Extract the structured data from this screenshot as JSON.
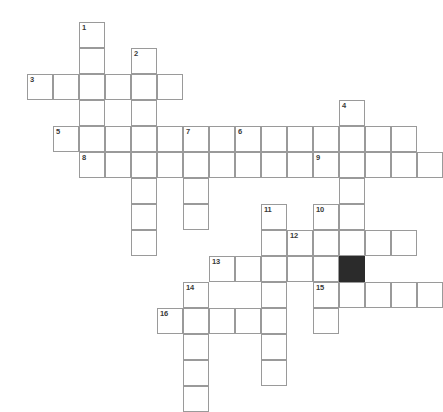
{
  "puzzle": {
    "title": "Crossword Grid",
    "grid": {
      "cell_size": 26,
      "origin_x": 1,
      "origin_y": 22,
      "columns": 17,
      "rows": 15,
      "line_color": "#9a9a9a",
      "cell_color": "#ffffff",
      "block_color": "#2b2b2b",
      "number_color": "#3a3a3a",
      "background": "#ffffff"
    },
    "blocks": [
      {
        "name": "block-cell",
        "col": 13,
        "row": 9
      }
    ],
    "entries": [
      {
        "number": "1",
        "direction": "down",
        "col": 3,
        "row": 0,
        "length": 6
      },
      {
        "number": "2",
        "direction": "down",
        "col": 5,
        "row": 1,
        "length": 7
      },
      {
        "number": "3",
        "direction": "across",
        "col": 1,
        "row": 2,
        "length": 6
      },
      {
        "number": "4",
        "direction": "down",
        "col": 13,
        "row": 3,
        "length": 4
      },
      {
        "number": "5",
        "direction": "across",
        "col": 2,
        "row": 4,
        "length": 7
      },
      {
        "number": "6",
        "direction": "across",
        "col": 9,
        "row": 4,
        "length": 7
      },
      {
        "number": "7",
        "direction": "down",
        "col": 7,
        "row": 4,
        "length": 4
      },
      {
        "number": "8",
        "direction": "across",
        "col": 3,
        "row": 5,
        "length": 11
      },
      {
        "number": "9",
        "direction": "across",
        "col": 12,
        "row": 5,
        "length": 5
      },
      {
        "number": "10",
        "direction": "down",
        "col": 12,
        "row": 7,
        "length": 3
      },
      {
        "number": "11",
        "direction": "down",
        "col": 10,
        "row": 7,
        "length": 6
      },
      {
        "number": "12",
        "direction": "across",
        "col": 11,
        "row": 8,
        "length": 5
      },
      {
        "number": "13",
        "direction": "across",
        "col": 8,
        "row": 9,
        "length": 6
      },
      {
        "number": "14",
        "direction": "down",
        "col": 7,
        "row": 10,
        "length": 5
      },
      {
        "number": "15",
        "direction": "across",
        "col": 12,
        "row": 10,
        "length": 5
      },
      {
        "number": "16",
        "direction": "across",
        "col": 6,
        "row": 11,
        "length": 5
      }
    ],
    "extra_cells": [
      {
        "name": "cell-c13-r7",
        "col": 13,
        "row": 7
      },
      {
        "name": "cell-c13-r8",
        "col": 13,
        "row": 8
      },
      {
        "name": "cell-c13-r10",
        "col": 13,
        "row": 10
      },
      {
        "name": "cell-c12-r9",
        "col": 12,
        "row": 9
      },
      {
        "name": "cell-c12-r11",
        "col": 12,
        "row": 11
      },
      {
        "name": "cell-c10-r13",
        "col": 10,
        "row": 13
      },
      {
        "name": "cell-c7-r12",
        "col": 7,
        "row": 12
      },
      {
        "name": "cell-c7-r13",
        "col": 7,
        "row": 13
      },
      {
        "name": "cell-c5-r8",
        "col": 5,
        "row": 8
      }
    ],
    "letters": []
  }
}
